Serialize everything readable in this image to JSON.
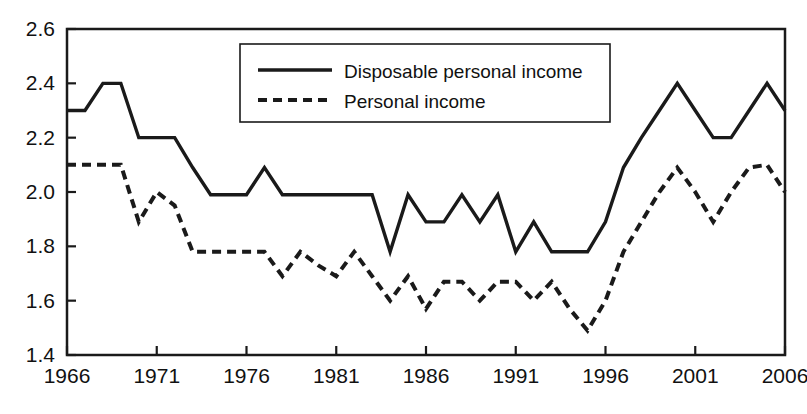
{
  "chart_data": {
    "type": "line",
    "title": "",
    "subtitle": "",
    "xlabel": "",
    "ylabel": "",
    "xlim": [
      1966,
      2006
    ],
    "ylim": [
      1.4,
      2.6
    ],
    "grid": false,
    "legend_position": "top-center",
    "x": [
      1966,
      1967,
      1968,
      1969,
      1970,
      1971,
      1972,
      1973,
      1974,
      1975,
      1976,
      1977,
      1978,
      1979,
      1980,
      1981,
      1982,
      1983,
      1984,
      1985,
      1986,
      1987,
      1988,
      1989,
      1990,
      1991,
      1992,
      1993,
      1994,
      1995,
      1996,
      1997,
      1998,
      1999,
      2000,
      2001,
      2002,
      2003,
      2004,
      2005,
      2006
    ],
    "xticks": [
      1966,
      1971,
      1976,
      1981,
      1986,
      1991,
      1996,
      2001,
      2006
    ],
    "xtick_labels": [
      "1966",
      "1971",
      "1976",
      "1981",
      "1986",
      "1991",
      "1996",
      "2001",
      "2006"
    ],
    "yticks": [
      1.4,
      1.6,
      1.8,
      2.0,
      2.2,
      2.4,
      2.6
    ],
    "ytick_labels": [
      "1.4",
      "1.6",
      "1.8",
      "2.0",
      "2.2",
      "2.4",
      "2.6"
    ],
    "series": [
      {
        "name": "Disposable personal income",
        "style": "solid",
        "color": "#1a1a1a",
        "values": [
          2.3,
          2.3,
          2.4,
          2.4,
          2.2,
          2.2,
          2.2,
          2.09,
          1.99,
          1.99,
          1.99,
          2.09,
          1.99,
          1.99,
          1.99,
          1.99,
          1.99,
          1.99,
          1.78,
          1.99,
          1.89,
          1.89,
          1.99,
          1.89,
          1.99,
          1.78,
          1.89,
          1.78,
          1.78,
          1.78,
          1.89,
          2.09,
          2.2,
          2.3,
          2.4,
          2.3,
          2.2,
          2.2,
          2.3,
          2.4,
          2.3
        ]
      },
      {
        "name": "Personal income",
        "style": "dashed",
        "color": "#1a1a1a",
        "values": [
          2.1,
          2.1,
          2.1,
          2.1,
          1.89,
          2.0,
          1.95,
          1.78,
          1.78,
          1.78,
          1.78,
          1.78,
          1.69,
          1.78,
          1.73,
          1.69,
          1.78,
          1.69,
          1.6,
          1.69,
          1.57,
          1.67,
          1.67,
          1.6,
          1.67,
          1.67,
          1.6,
          1.67,
          1.57,
          1.49,
          1.6,
          1.78,
          1.89,
          2.0,
          2.09,
          2.0,
          1.89,
          2.0,
          2.09,
          2.1,
          2.0
        ]
      }
    ]
  },
  "legend": {
    "entries": [
      {
        "label": "Disposable personal income",
        "style": "solid"
      },
      {
        "label": "Personal income",
        "style": "dashed"
      }
    ]
  },
  "axes": {
    "frame_color": "#1a1a1a"
  }
}
